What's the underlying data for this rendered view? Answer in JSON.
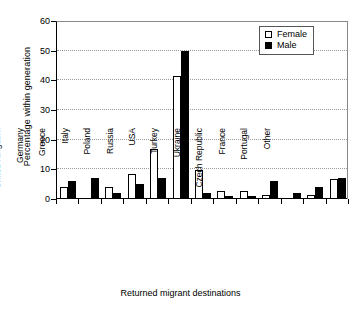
{
  "chart_data": {
    "type": "bar",
    "title": "",
    "xlabel": "Returned migrant destinations",
    "ylabel": "Percentage within generation",
    "ylim": [
      0,
      60
    ],
    "yticks": [
      0,
      10,
      20,
      30,
      40,
      50,
      60
    ],
    "grid": true,
    "legend_position": "top-right",
    "categories": [
      "United Kingdom",
      "Germany",
      "Greece",
      "Italy",
      "Poland",
      "Russia",
      "USA",
      "Turkey",
      "Ukraine",
      "Czech Republic",
      "France",
      "Portugal",
      "Other"
    ],
    "series": [
      {
        "name": "Female",
        "color": "#ffffff",
        "values": [
          4.0,
          0.0,
          4.2,
          8.3,
          16.7,
          41.5,
          9.7,
          2.7,
          2.7,
          1.5,
          0.0,
          1.5,
          6.7
        ]
      },
      {
        "name": "Male",
        "color": "#000000",
        "values": [
          6.0,
          7.0,
          2.0,
          5.0,
          7.0,
          50.0,
          2.0,
          1.0,
          1.0,
          6.0,
          2.0,
          4.0,
          7.0
        ]
      }
    ]
  },
  "legend": {
    "items": [
      {
        "label": "Female",
        "swatch": "open-square-icon"
      },
      {
        "label": "Male",
        "swatch": "filled-square-icon"
      }
    ]
  },
  "axes": {
    "y_title": "Percentage within generation",
    "x_title": "Returned migrant destinations",
    "y_tick_labels": [
      "0",
      "10",
      "20",
      "30",
      "40",
      "50",
      "60"
    ]
  }
}
